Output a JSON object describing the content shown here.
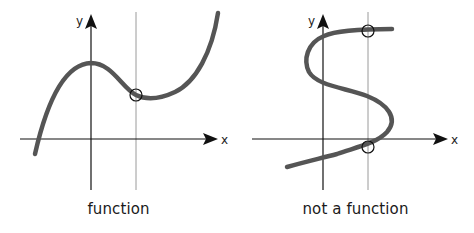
{
  "colors": {
    "axis": "#111111",
    "curve": "#555555",
    "guide_line": "#9a9a9a",
    "marker": "#111111",
    "background": "#ffffff"
  },
  "panels": [
    {
      "id": "function",
      "caption": "function",
      "x_axis_label": "x",
      "y_axis_label": "y",
      "curve_description": "cubic-like curve passing vertical line once",
      "intersection_count": 1
    },
    {
      "id": "not-a-function",
      "caption": "not a function",
      "x_axis_label": "x",
      "y_axis_label": "y",
      "curve_description": "S-shaped curve passing vertical line twice",
      "intersection_count": 2
    }
  ],
  "legend_concept": "vertical line test"
}
